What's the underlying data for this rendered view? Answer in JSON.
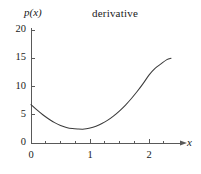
{
  "chart_data": {
    "type": "line",
    "title": "derivative",
    "xlabel": "x",
    "ylabel": "p(x)",
    "xlim": [
      0,
      2.37
    ],
    "ylim": [
      0,
      20
    ],
    "grid": false,
    "legend": null,
    "xticks": [
      0,
      1,
      2
    ],
    "xtick_labels": [
      "0",
      "1",
      "2"
    ],
    "xminor_ticks": [
      0.25,
      0.5,
      0.75,
      1.25,
      1.5,
      1.75,
      2.25
    ],
    "yticks": [
      0,
      5,
      10,
      15,
      20
    ],
    "ytick_labels": [
      "0",
      "5",
      "10",
      "15",
      "20"
    ],
    "series": [
      {
        "name": "p(x)",
        "x": [
          0.0,
          0.1,
          0.2,
          0.3,
          0.4,
          0.5,
          0.6,
          0.7,
          0.8,
          0.87,
          0.9,
          1.0,
          1.1,
          1.2,
          1.3,
          1.4,
          1.5,
          1.6,
          1.7,
          1.8,
          1.9,
          2.0,
          2.1,
          2.2,
          2.3,
          2.37
        ],
        "y": [
          6.8,
          5.85,
          5.0,
          4.25,
          3.6,
          3.1,
          2.75,
          2.55,
          2.47,
          2.45,
          2.47,
          2.65,
          2.98,
          3.45,
          4.05,
          4.8,
          5.7,
          6.72,
          7.88,
          9.15,
          10.55,
          12.05,
          13.2,
          14.0,
          14.75,
          15.0
        ]
      }
    ],
    "line_color": "#3b3b3b",
    "axis_color": "#595959"
  },
  "axes": {
    "title": "derivative",
    "y_axis_label": "p(x)",
    "x_axis_label": "x"
  }
}
